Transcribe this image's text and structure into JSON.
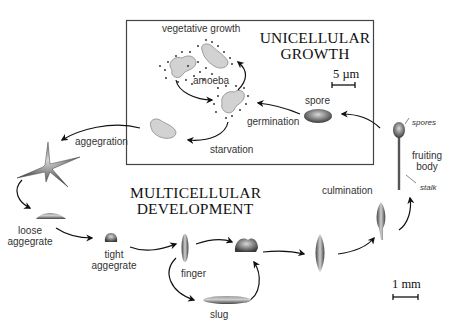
{
  "panels": {
    "unicellular": {
      "title_line1": "UNICELLULAR",
      "title_line2": "GROWTH",
      "scale_bar": "5 µm"
    },
    "multicellular": {
      "title_line1": "MULTICELLULAR",
      "title_line2": "DEVELOPMENT",
      "scale_bar": "1 mm"
    }
  },
  "labels": {
    "vegetative_growth": "vegetative growth",
    "amoeba": "amoeba",
    "germination": "germination",
    "spore": "spore",
    "starvation": "starvation",
    "aggregation": "aggegration",
    "loose_aggregate_1": "loose",
    "loose_aggregate_2": "aggegrate",
    "tight_aggregate_1": "tight",
    "tight_aggregate_2": "aggegrate",
    "finger": "finger",
    "slug": "slug",
    "culmination": "culmination",
    "fruiting_body_1": "fruiting",
    "fruiting_body_2": "body",
    "spores": "spores",
    "stalk": "stalk"
  },
  "colors": {
    "amoeba_fill": "#d2d2d2",
    "amoeba_stroke": "#8a8a8a",
    "body_dark": "#555555",
    "arrow": "#111111",
    "frame": "#444444"
  }
}
